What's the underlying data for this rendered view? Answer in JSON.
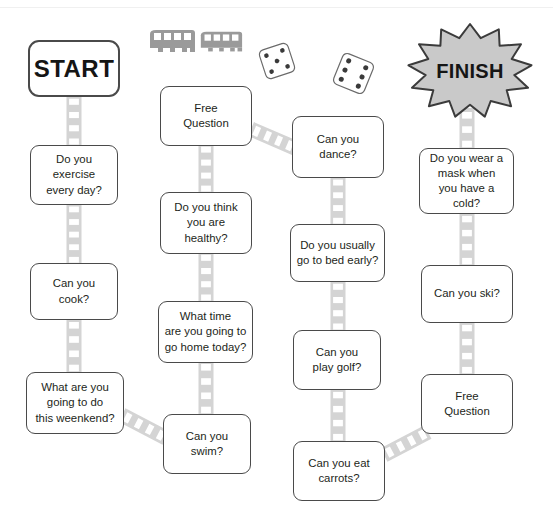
{
  "board": {
    "title": "Question Board Game",
    "width": 553,
    "height": 530,
    "background_color": "#ffffff",
    "card_border_color": "#4a4a4a",
    "ladder_color": "#d4d4d4",
    "ladder_rung_color": "#ffffff",
    "finish_fill_color": "#c9c9c9",
    "finish_outline_color": "#3b3b3b",
    "vehicle_color": "#9a9a9a",
    "die_fill_color": "#ffffff",
    "die_pip_color": "#3a3a3a"
  },
  "start": {
    "label": "START",
    "name": "start-tile",
    "x": 28,
    "y": 40,
    "w": 92,
    "h": 57
  },
  "finish": {
    "label": "FINISH",
    "name": "finish-tile",
    "cx": 470,
    "cy": 71,
    "rx": 62,
    "ry": 47,
    "points": 13
  },
  "tiles": [
    {
      "id": 1,
      "name": "tile-exercise",
      "text": "Do you\nexercise\nevery day?",
      "x": 30,
      "y": 145,
      "w": 88,
      "h": 60,
      "column": 1
    },
    {
      "id": 2,
      "name": "tile-cook",
      "text": "Can you\ncook?",
      "x": 30,
      "y": 263,
      "w": 88,
      "h": 57,
      "column": 1
    },
    {
      "id": 3,
      "name": "tile-weekend",
      "text": "What are you\ngoing to do\nthis weenkend?",
      "x": 26,
      "y": 372,
      "w": 98,
      "h": 62,
      "column": 1
    },
    {
      "id": 4,
      "name": "tile-swim",
      "text": "Can you\nswim?",
      "x": 163,
      "y": 414,
      "w": 88,
      "h": 60,
      "column": 2
    },
    {
      "id": 5,
      "name": "tile-go-home",
      "text": "What time\nare you going to\ngo home today?",
      "x": 158,
      "y": 301,
      "w": 95,
      "h": 62,
      "column": 2
    },
    {
      "id": 6,
      "name": "tile-healthy",
      "text": "Do you think\nyou are\nhealthy?",
      "x": 160,
      "y": 192,
      "w": 92,
      "h": 62,
      "column": 2
    },
    {
      "id": 7,
      "name": "tile-free-question-upper",
      "text": "Free\nQuestion",
      "x": 160,
      "y": 86,
      "w": 92,
      "h": 60,
      "column": 2
    },
    {
      "id": 8,
      "name": "tile-dance",
      "text": "Can you\ndance?",
      "x": 292,
      "y": 116,
      "w": 92,
      "h": 62,
      "column": 3
    },
    {
      "id": 9,
      "name": "tile-bed-early",
      "text": "Do you usually\ngo to bed early?",
      "x": 290,
      "y": 224,
      "w": 95,
      "h": 58,
      "column": 3
    },
    {
      "id": 10,
      "name": "tile-golf",
      "text": "Can you\nplay golf?",
      "x": 293,
      "y": 330,
      "w": 88,
      "h": 60,
      "column": 3
    },
    {
      "id": 11,
      "name": "tile-carrots",
      "text": "Can you eat\ncarrots?",
      "x": 293,
      "y": 441,
      "w": 92,
      "h": 60,
      "column": 3
    },
    {
      "id": 12,
      "name": "tile-free-question-lower",
      "text": "Free\nQuestion",
      "x": 421,
      "y": 374,
      "w": 92,
      "h": 60,
      "column": 4
    },
    {
      "id": 13,
      "name": "tile-ski",
      "text": "Can you ski?",
      "x": 421,
      "y": 265,
      "w": 92,
      "h": 58,
      "column": 4
    },
    {
      "id": 14,
      "name": "tile-mask",
      "text": "Do you wear a\nmask when\nyou have a\ncold?",
      "x": 419,
      "y": 148,
      "w": 95,
      "h": 66,
      "column": 4
    }
  ],
  "connectors": [
    {
      "name": "ladder-start-to-exercise",
      "type": "vertical",
      "x": 74,
      "y1": 95,
      "y2": 148
    },
    {
      "name": "ladder-exercise-to-cook",
      "type": "vertical",
      "x": 74,
      "y1": 203,
      "y2": 266
    },
    {
      "name": "ladder-cook-to-weekend",
      "type": "vertical",
      "x": 74,
      "y1": 318,
      "y2": 375
    },
    {
      "name": "ladder-weekend-to-swim",
      "type": "diagonal",
      "x1": 122,
      "y1": 415,
      "x2": 166,
      "y2": 438
    },
    {
      "name": "ladder-swim-to-gohome",
      "type": "vertical",
      "x": 206,
      "y1": 360,
      "y2": 417
    },
    {
      "name": "ladder-gohome-to-healthy",
      "type": "vertical",
      "x": 206,
      "y1": 251,
      "y2": 304
    },
    {
      "name": "ladder-healthy-to-free",
      "type": "vertical",
      "x": 206,
      "y1": 143,
      "y2": 195
    },
    {
      "name": "ladder-free-to-dance",
      "type": "diagonal",
      "x1": 251,
      "y1": 129,
      "x2": 295,
      "y2": 148
    },
    {
      "name": "ladder-dance-to-bed",
      "type": "vertical",
      "x": 338,
      "y1": 176,
      "y2": 227
    },
    {
      "name": "ladder-bed-to-golf",
      "type": "vertical",
      "x": 338,
      "y1": 280,
      "y2": 333
    },
    {
      "name": "ladder-golf-to-carrots",
      "type": "vertical",
      "x": 338,
      "y1": 388,
      "y2": 444
    },
    {
      "name": "ladder-carrots-to-free",
      "type": "diagonal",
      "x1": 384,
      "y1": 455,
      "x2": 428,
      "y2": 432
    },
    {
      "name": "ladder-free-to-ski",
      "type": "vertical",
      "x": 467,
      "y1": 321,
      "y2": 377
    },
    {
      "name": "ladder-ski-to-mask",
      "type": "vertical",
      "x": 467,
      "y1": 212,
      "y2": 268
    },
    {
      "name": "ladder-mask-to-finish",
      "type": "vertical",
      "x": 467,
      "y1": 108,
      "y2": 151
    }
  ],
  "decorations": [
    {
      "name": "bus-icon-left",
      "type": "bus",
      "x": 148,
      "y": 28,
      "w": 48,
      "h": 28
    },
    {
      "name": "bus-icon-right",
      "type": "bus",
      "x": 199,
      "y": 30,
      "w": 44,
      "h": 25
    },
    {
      "name": "die-icon-left",
      "type": "die",
      "x": 262,
      "y": 46,
      "w": 30,
      "h": 30,
      "rotation": -18,
      "pips": 5
    },
    {
      "name": "die-icon-right",
      "type": "die",
      "x": 337,
      "y": 57,
      "w": 33,
      "h": 33,
      "rotation": 22,
      "pips": 6
    }
  ]
}
